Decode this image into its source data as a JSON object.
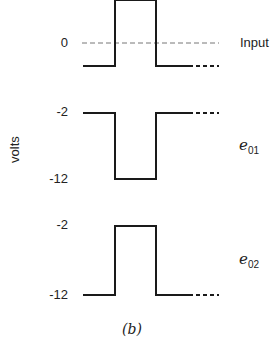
{
  "diagram": {
    "caption": "(b)",
    "y_axis_label": "volts",
    "colors": {
      "line": "#1a1a1a",
      "dashed_ref": "#777777",
      "background": "#ffffff"
    },
    "signals": [
      {
        "id": "input",
        "label": "Input",
        "ref_level_label": "0",
        "levels": {
          "low": "below 0",
          "high": "above 0"
        },
        "shape": "positive pulse",
        "zero_reference": "dashed line"
      },
      {
        "id": "e01",
        "label_main": "e",
        "label_sub": "01",
        "high_label": "-2",
        "low_label": "-12",
        "shape": "negative pulse"
      },
      {
        "id": "e02",
        "label_main": "e",
        "label_sub": "02",
        "high_label": "-2",
        "low_label": "-12",
        "shape": "positive pulse"
      }
    ]
  }
}
